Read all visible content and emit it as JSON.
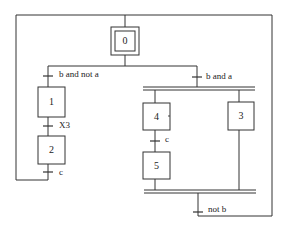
{
  "diagram": {
    "type": "GRAFCET",
    "steps": [
      {
        "id": "0",
        "initial": true
      },
      {
        "id": "1"
      },
      {
        "id": "2"
      },
      {
        "id": "3"
      },
      {
        "id": "4"
      },
      {
        "id": "5"
      }
    ],
    "transitions": [
      {
        "label": "b and not a"
      },
      {
        "label": "X3"
      },
      {
        "label": "c"
      },
      {
        "label": "b and a"
      },
      {
        "label": "c"
      },
      {
        "label": "not b"
      }
    ]
  }
}
